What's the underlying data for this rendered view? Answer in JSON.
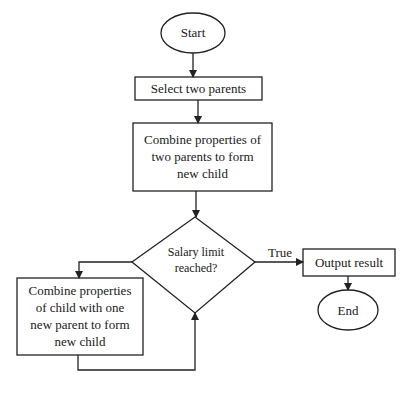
{
  "flowchart": {
    "start": {
      "label": "Start"
    },
    "select": {
      "label": "Select two parents"
    },
    "combine_parents": {
      "label": "Combine properties of two parents to form new child"
    },
    "decision": {
      "label": "Salary limit reached?"
    },
    "true_edge": {
      "label": "True"
    },
    "output": {
      "label": "Output result"
    },
    "end": {
      "label": "End"
    },
    "combine_child": {
      "label": "Combine properties of child with one new parent to form new child"
    }
  },
  "colors": {
    "stroke": "#222222",
    "background": "#ffffff"
  }
}
